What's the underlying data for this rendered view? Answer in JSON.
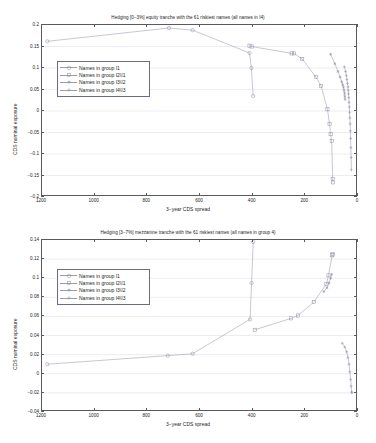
{
  "figure": {
    "background": "#ffffff",
    "line_color": "#9a9ab0",
    "grid_color": "#d9d9e2",
    "axis_color": "#5a5a5a",
    "legend_border_color": "#6a6a8a"
  },
  "chart_data": [
    {
      "type": "line",
      "id": "equity-tranche",
      "title": "Hedging [0−3%] equity tranche with the 61 riskiest names (all names in I4)",
      "xlabel": "3−year CDS spread",
      "ylabel": "CDS nominal exposure",
      "xlim": [
        1200,
        0
      ],
      "ylim": [
        -0.2,
        0.2
      ],
      "x_reversed": true,
      "grid": true,
      "legend_position": "upper left",
      "xticks": [
        1200,
        1000,
        800,
        600,
        400,
        200,
        0
      ],
      "xticklabels": [
        "1200",
        "1000",
        "800",
        "600",
        "400",
        "200",
        "0"
      ],
      "yticks": [
        -0.2,
        -0.15,
        -0.1,
        -0.05,
        0,
        0.05,
        0.1,
        0.15,
        0.2
      ],
      "yticklabels": [
        "−0.2",
        "−0.15",
        "−0.1",
        "−0.05",
        "0",
        "0.05",
        "0.1",
        "0.15",
        "0.2"
      ],
      "series": [
        {
          "name": "Names in group I1",
          "marker": "circle",
          "points": [
            [
              1180,
              0.162
            ],
            [
              718,
              0.193
            ],
            [
              628,
              0.188
            ],
            [
              412,
              0.135
            ],
            [
              405,
              0.1
            ],
            [
              398,
              0.035
            ]
          ]
        },
        {
          "name": "Names in group I2\\I1",
          "marker": "square",
          "points": [
            [
              412,
              0.152
            ],
            [
              404,
              0.15
            ],
            [
              252,
              0.134
            ],
            [
              243,
              0.134
            ],
            [
              212,
              0.121
            ],
            [
              160,
              0.079
            ],
            [
              140,
              0.058
            ],
            [
              116,
              0.004
            ],
            [
              108,
              -0.03
            ],
            [
              104,
              -0.054
            ],
            [
              100,
              -0.07
            ],
            [
              96,
              -0.158
            ],
            [
              95,
              -0.166
            ]
          ]
        },
        {
          "name": "Names in group I3\\I2",
          "marker": "asterisk",
          "points": [
            [
              104,
              0.132
            ],
            [
              88,
              0.11
            ],
            [
              76,
              0.092
            ],
            [
              68,
              0.079
            ],
            [
              62,
              0.068
            ],
            [
              58,
              0.061
            ],
            [
              55,
              0.055
            ],
            [
              53,
              0.048
            ],
            [
              51,
              0.041
            ],
            [
              50,
              0.034
            ],
            [
              49,
              0.027
            ]
          ]
        },
        {
          "name": "Names in group I4\\I3",
          "marker": "plus",
          "points": [
            [
              52,
              0.103
            ],
            [
              47,
              0.092
            ],
            [
              44,
              0.082
            ],
            [
              42,
              0.073
            ],
            [
              40,
              0.064
            ],
            [
              38,
              0.056
            ],
            [
              37,
              0.048
            ],
            [
              36,
              0.04
            ],
            [
              35,
              0.031
            ],
            [
              34,
              0.02
            ],
            [
              33,
              0.009
            ],
            [
              32,
              -0.003
            ],
            [
              31,
              -0.016
            ],
            [
              30,
              -0.03
            ],
            [
              29,
              -0.046
            ],
            [
              28,
              -0.064
            ],
            [
              27,
              -0.085
            ],
            [
              26,
              -0.108
            ],
            [
              25,
              -0.137
            ]
          ]
        }
      ]
    },
    {
      "type": "line",
      "id": "mezzanine-tranche",
      "title": "Hedging [3−7%] mezzanine tranche with the 61 riskiest names (all names in group 4)",
      "xlabel": "3−year CDS spread",
      "ylabel": "CDS nominal exposure",
      "xlim": [
        1200,
        0
      ],
      "ylim": [
        -0.04,
        0.14
      ],
      "x_reversed": true,
      "grid": true,
      "legend_position": "upper left",
      "xticks": [
        1200,
        1000,
        800,
        600,
        400,
        200,
        0
      ],
      "xticklabels": [
        "1200",
        "1000",
        "800",
        "600",
        "400",
        "200",
        "0"
      ],
      "yticks": [
        -0.04,
        -0.02,
        0,
        0.02,
        0.04,
        0.06,
        0.08,
        0.1,
        0.12,
        0.14
      ],
      "yticklabels": [
        "−0.04",
        "−0.02",
        "0",
        "0.02",
        "0.04",
        "0.06",
        "0.08",
        "0.1",
        "0.12",
        "0.14"
      ],
      "series": [
        {
          "name": "Names in group I1",
          "marker": "circle",
          "points": [
            [
              1180,
              0.01
            ],
            [
              722,
              0.019
            ],
            [
              628,
              0.021
            ],
            [
              410,
              0.057
            ],
            [
              404,
              0.095
            ],
            [
              398,
              0.138
            ]
          ]
        },
        {
          "name": "Names in group I2\\I1",
          "marker": "square",
          "points": [
            [
              392,
              0.046
            ],
            [
              254,
              0.058
            ],
            [
              228,
              0.061
            ],
            [
              168,
              0.075
            ],
            [
              120,
              0.094
            ],
            [
              112,
              0.103
            ],
            [
              98,
              0.124
            ],
            [
              96,
              0.125
            ]
          ]
        },
        {
          "name": "Names in group I3\\I2",
          "marker": "asterisk",
          "points": [
            [
              130,
              0.086
            ],
            [
              118,
              0.09
            ],
            [
              110,
              0.095
            ],
            [
              104,
              0.1
            ],
            [
              100,
              0.104
            ]
          ]
        },
        {
          "name": "Names in group I4\\I3",
          "marker": "plus",
          "points": [
            [
              60,
              0.032
            ],
            [
              50,
              0.028
            ],
            [
              43,
              0.023
            ],
            [
              38,
              0.017
            ],
            [
              34,
              0.01
            ],
            [
              31,
              0.002
            ],
            [
              28,
              -0.006
            ],
            [
              26,
              -0.013
            ],
            [
              24,
              -0.019
            ],
            [
              23,
              -0.02
            ]
          ]
        }
      ]
    }
  ]
}
